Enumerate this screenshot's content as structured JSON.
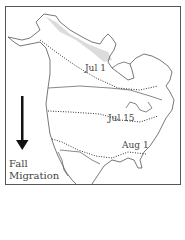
{
  "map": {
    "title_lines": [
      "Fall",
      "Migration"
    ],
    "arrow_direction": "down",
    "isolines": [
      {
        "label": "Jul 1"
      },
      {
        "label": "Jul 15"
      },
      {
        "label": "Aug 1"
      }
    ],
    "colors": {
      "outline": "#555555",
      "shading": "#d8d8d8",
      "text": "#444444"
    }
  }
}
